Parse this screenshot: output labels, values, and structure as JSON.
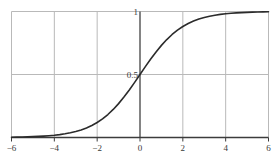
{
  "chart_data": {
    "type": "line",
    "title": "",
    "subtitle": "",
    "xlabel": "",
    "ylabel": "",
    "xlim": [
      -6,
      6
    ],
    "ylim": [
      0,
      1
    ],
    "grid": true,
    "legend": null,
    "legend_position": "none",
    "x_ticks": [
      -6,
      -4,
      -2,
      0,
      2,
      4,
      6
    ],
    "x_tick_labels": [
      "−6",
      "−4",
      "−2",
      "0",
      "2",
      "4",
      "6"
    ],
    "y_ticks": [
      0.5,
      1
    ],
    "y_tick_labels": [
      "0.5",
      "1"
    ],
    "gridlines_x": [
      -6,
      -4,
      -2,
      0,
      2,
      4,
      6
    ],
    "gridlines_y": [
      0.5,
      1
    ],
    "series": [
      {
        "name": "sigmoid",
        "formula": "y = 1 / (1 + e^(-x))",
        "color": "#2b2b2b",
        "line_width": 1.6,
        "x": [
          -6.0,
          -5.75,
          -5.5,
          -5.25,
          -5.0,
          -4.75,
          -4.5,
          -4.25,
          -4.0,
          -3.75,
          -3.5,
          -3.25,
          -3.0,
          -2.75,
          -2.5,
          -2.25,
          -2.0,
          -1.75,
          -1.5,
          -1.25,
          -1.0,
          -0.75,
          -0.5,
          -0.25,
          0.0,
          0.25,
          0.5,
          0.75,
          1.0,
          1.25,
          1.5,
          1.75,
          2.0,
          2.25,
          2.5,
          2.75,
          3.0,
          3.25,
          3.5,
          3.75,
          4.0,
          4.25,
          4.5,
          4.75,
          5.0,
          5.25,
          5.5,
          5.75,
          6.0
        ],
        "values": [
          0.0025,
          0.0032,
          0.0041,
          0.0052,
          0.0067,
          0.0086,
          0.011,
          0.0141,
          0.018,
          0.023,
          0.0293,
          0.0373,
          0.0474,
          0.0601,
          0.0759,
          0.0953,
          0.1192,
          0.148,
          0.1824,
          0.2227,
          0.2689,
          0.3208,
          0.3775,
          0.4378,
          0.5,
          0.5622,
          0.6225,
          0.6792,
          0.7311,
          0.7773,
          0.8176,
          0.852,
          0.8808,
          0.9047,
          0.9241,
          0.9399,
          0.9526,
          0.9627,
          0.9707,
          0.977,
          0.982,
          0.9859,
          0.989,
          0.9914,
          0.9933,
          0.9948,
          0.9959,
          0.9968,
          0.9975
        ]
      }
    ],
    "colors": {
      "curve": "#2b2b2b",
      "grid": "#b9b9b9",
      "axis": "#3c3c3c",
      "background": "#ffffff",
      "tick_text": "#3a3a3a"
    },
    "annotations": [
      {
        "text": "1",
        "x": 0,
        "y": 1,
        "placement": "left-of-y-axis"
      },
      {
        "text": "0.5",
        "x": 0,
        "y": 0.5,
        "placement": "left-of-y-axis"
      }
    ]
  }
}
